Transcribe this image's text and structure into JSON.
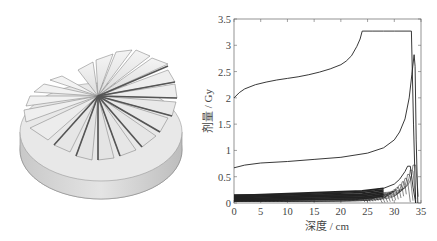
{
  "figure": {
    "left_panel": {
      "description": "3D range modulator wheel (stepped propeller-like disk)",
      "blade_count": 16
    }
  },
  "chart_data": {
    "type": "line",
    "title": "",
    "xlabel": "深度 / cm",
    "ylabel": "剂量 / Gy",
    "xlim": [
      0,
      35
    ],
    "ylim": [
      0,
      3.5
    ],
    "xticks": [
      0,
      5,
      10,
      15,
      20,
      25,
      30,
      35
    ],
    "xtick_labels": [
      "0",
      "5",
      "10",
      "15",
      "20",
      "25",
      "30",
      "35"
    ],
    "yticks": [
      0,
      0.5,
      1,
      1.5,
      2,
      2.5,
      3,
      3.5
    ],
    "ytick_labels": [
      "0",
      "0.5",
      "1",
      "1.5",
      "2",
      "2.5",
      "3",
      "3.5"
    ],
    "grid": false,
    "legend": null,
    "series": [
      {
        "name": "SOBP (total dose)",
        "x": [
          0,
          1,
          2,
          4,
          6,
          8,
          10,
          12,
          14,
          16,
          18,
          20,
          21,
          22,
          23,
          23.6,
          24,
          26,
          28,
          30,
          32,
          33.2,
          33.6,
          34.0
        ],
        "y": [
          2.0,
          2.1,
          2.17,
          2.25,
          2.3,
          2.34,
          2.37,
          2.4,
          2.44,
          2.49,
          2.55,
          2.63,
          2.7,
          2.8,
          2.98,
          3.12,
          3.27,
          3.27,
          3.27,
          3.27,
          3.27,
          3.27,
          1.5,
          0.0
        ]
      },
      {
        "name": "Pristine Bragg peak (max energy)",
        "x": [
          0,
          2,
          5,
          10,
          15,
          20,
          25,
          28,
          30,
          31,
          32,
          32.8,
          33.3,
          33.7,
          33.9,
          34.1,
          34.4
        ],
        "y": [
          0.67,
          0.72,
          0.76,
          0.79,
          0.83,
          0.87,
          0.95,
          1.05,
          1.2,
          1.35,
          1.6,
          2.0,
          2.45,
          2.82,
          2.6,
          1.2,
          0.0
        ]
      },
      {
        "name": "Weighted Bragg peaks (group)",
        "x": [
          0,
          10,
          20,
          25,
          28,
          30,
          31,
          32,
          32.5,
          33,
          33.5,
          34
        ],
        "y": [
          0.15,
          0.17,
          0.2,
          0.23,
          0.28,
          0.36,
          0.45,
          0.6,
          0.7,
          0.7,
          0.3,
          0.0
        ]
      }
    ],
    "bragg_peak_family": {
      "count": 20,
      "peak_depth_range_cm": [
        24,
        34
      ],
      "entrance_dose_range_Gy": [
        0.03,
        0.15
      ],
      "max_peak_Gy": 0.72
    }
  }
}
